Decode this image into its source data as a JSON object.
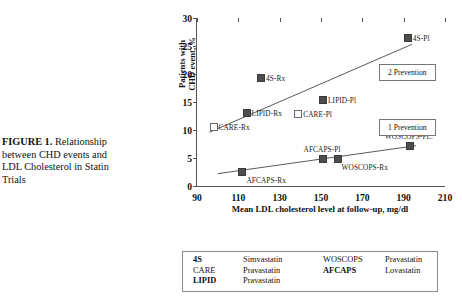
{
  "caption": {
    "label": "FIGURE 1.",
    "text": " Relationship between CHD events and LDL Cholesterol in Statin Trials"
  },
  "chart_data": {
    "type": "scatter",
    "title": "Relationship between CHD events and LDL Cholesterol in Statin Trials",
    "xlabel": "Mean LDL cholesterol level at follow-up, mg/dl",
    "ylabel_line1": "Patients with",
    "ylabel_line2": "CHD event, %",
    "xlim": [
      90,
      210
    ],
    "ylim": [
      0,
      30
    ],
    "xticks": [
      90,
      110,
      130,
      150,
      170,
      190,
      210
    ],
    "yticks": [
      0,
      5,
      10,
      15,
      20,
      25,
      30
    ],
    "grid": false,
    "series": [
      {
        "name": "2 Prevention",
        "annotation": "2 Prevention",
        "trendline": {
          "x1": 96,
          "y1": 9.6,
          "x2": 194,
          "y2": 25.3
        },
        "points": [
          {
            "label": "CARE-Rx",
            "x": 98,
            "y": 10.5,
            "marker": "open",
            "label_pos": "right"
          },
          {
            "label": "LIPID-Rx",
            "x": 114,
            "y": 13.0,
            "marker": "filled",
            "label_pos": "right"
          },
          {
            "label": "4S-Rx",
            "x": 121,
            "y": 19.3,
            "marker": "filled",
            "label_pos": "right"
          },
          {
            "label": "CARE-Pl",
            "x": 139,
            "y": 12.8,
            "marker": "open",
            "label_pos": "right"
          },
          {
            "label": "LIPID-Pl",
            "x": 151,
            "y": 15.3,
            "marker": "filled",
            "label_pos": "right"
          },
          {
            "label": "4S-Pl",
            "x": 192,
            "y": 26.4,
            "marker": "filled",
            "label_pos": "right"
          }
        ]
      },
      {
        "name": "1 Prevention",
        "annotation": "1 Prevention",
        "trendline": {
          "x1": 100,
          "y1": 2.2,
          "x2": 196,
          "y2": 7.2
        },
        "points": [
          {
            "label": "AFCAPS-Rx",
            "x": 112,
            "y": 2.5,
            "marker": "filled",
            "label_pos": "below-right"
          },
          {
            "label": "AFCAPS-Pl",
            "x": 151,
            "y": 4.9,
            "marker": "filled",
            "label_pos": "above"
          },
          {
            "label": "WOSCOPS-Rx",
            "x": 158,
            "y": 4.9,
            "marker": "filled",
            "label_pos": "below-right"
          },
          {
            "label": "WOSCOPS-PL.",
            "x": 193,
            "y": 7.2,
            "marker": "filled",
            "label_pos": "above"
          }
        ]
      }
    ]
  },
  "annotations": {
    "secondary_prevention": "2 Prevention",
    "primary_prevention": "1 Prevention"
  },
  "legend": {
    "rows": [
      {
        "c0": "4S",
        "c0_dim": false,
        "c1": "Simvastatin",
        "c1_dim": false,
        "c2": "WOSCOPS",
        "c2_dim": true,
        "c3": "Pravastatin",
        "c3_dim": true
      },
      {
        "c0": "CARE",
        "c0_dim": true,
        "c1": "Pravastatin",
        "c1_dim": true,
        "c2": "AFCAPS",
        "c2_dim": false,
        "c3": "Lovastatin",
        "c3_dim": false
      },
      {
        "c0": "LIPID",
        "c0_dim": false,
        "c1": "Pravastatin",
        "c1_dim": false,
        "c2": "",
        "c2_dim": false,
        "c3": "",
        "c3_dim": false
      }
    ]
  },
  "colors": {
    "marker_filled": "#4d4d4d",
    "marker_open": "#ffffff",
    "axis": "#555555",
    "dim_text": "#c2c2c2",
    "text": "#1a1a1a"
  }
}
